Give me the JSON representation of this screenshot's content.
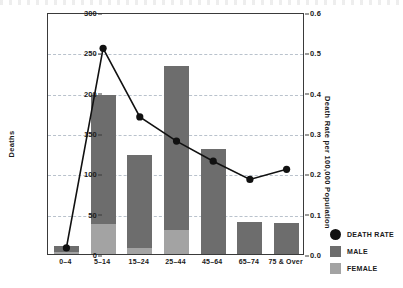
{
  "chart_data": {
    "type": "bar",
    "title": "",
    "subtitle": "",
    "xlabel": "",
    "ylabel": "Deaths",
    "ylabel_secondary": "Death Rate per 100,000 Population",
    "categories": [
      "0–4",
      "5–14",
      "15–24",
      "25–44",
      "45–64",
      "65–74",
      "75 & Over"
    ],
    "ylim": [
      0,
      300
    ],
    "yticks": [
      0,
      50,
      100,
      150,
      200,
      250,
      300
    ],
    "ylim_secondary": [
      0.0,
      0.6
    ],
    "yticks_secondary": [
      "0.0",
      "0.1",
      "0.2",
      "0.3",
      "0.4",
      "0.5",
      "0.6"
    ],
    "grid": true,
    "legend_position": "right-bottom",
    "series": [
      {
        "name": "MALE",
        "type": "bar",
        "stacked": true,
        "axis": "left",
        "color": "#6d6d6d",
        "values": [
          8,
          160,
          115,
          203,
          130,
          40,
          38
        ]
      },
      {
        "name": "FEMALE",
        "type": "bar",
        "stacked": true,
        "axis": "left",
        "color": "#a3a3a3",
        "values": [
          2,
          37,
          8,
          30,
          0,
          0,
          0
        ]
      },
      {
        "name": "DEATH RATE",
        "type": "line",
        "axis": "right",
        "color": "#111111",
        "marker": "circle",
        "values": [
          0.02,
          0.515,
          0.345,
          0.285,
          0.235,
          0.19,
          0.215
        ]
      }
    ],
    "totals": [
      10,
      197,
      123,
      233,
      130,
      40,
      38
    ]
  },
  "axes": {
    "left": {
      "title": "Deaths",
      "ticks": [
        "0",
        "50",
        "100",
        "150",
        "200",
        "250",
        "300"
      ]
    },
    "right": {
      "title": "Death Rate per 100,000 Population",
      "ticks": [
        "0.0",
        "0.1",
        "0.2",
        "0.3",
        "0.4",
        "0.5",
        "0.6"
      ]
    },
    "bottom": {
      "ticks": [
        "0–4",
        "5–14",
        "15–24",
        "25–44",
        "45–64",
        "65–74",
        "75 & Over"
      ]
    }
  },
  "legend": {
    "items": [
      {
        "label": "DEATH RATE",
        "marker": "circle",
        "color": "#111111"
      },
      {
        "label": "MALE",
        "marker": "square",
        "color": "#6d6d6d"
      },
      {
        "label": "FEMALE",
        "marker": "square",
        "color": "#a3a3a3"
      }
    ]
  },
  "colors": {
    "male": "#6d6d6d",
    "female": "#a3a3a3",
    "line": "#111111",
    "grid": "#b9c2cc",
    "axis": "#3a3a3a",
    "background": "#ffffff"
  }
}
